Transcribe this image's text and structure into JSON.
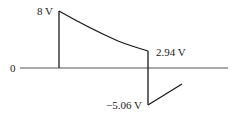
{
  "diagram": {
    "type": "voltage-waveform",
    "axis_label_zero": "0",
    "labels": {
      "peak": "8 V",
      "decay_end": "2.94 V",
      "negative_jump": "−5.06 V"
    },
    "colors": {
      "line": "#1a1a1a",
      "axis": "#555555",
      "text": "#222222"
    },
    "points": {
      "axis_y": 68,
      "axis_x_start": 20,
      "axis_x_end": 228,
      "rise_x": 59,
      "peak_y": 11,
      "drop_x": 148,
      "decay_end_y": 51,
      "neg_y": 105,
      "tail_end_x": 182,
      "tail_end_y": 84
    }
  }
}
